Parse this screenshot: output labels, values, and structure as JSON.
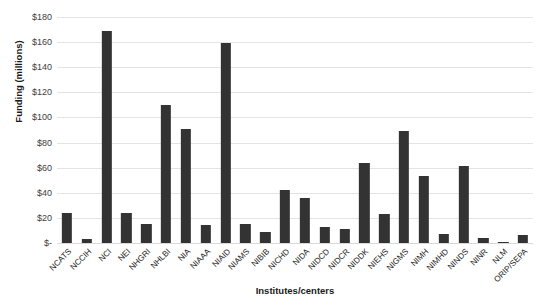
{
  "chart_data": {
    "type": "bar",
    "title": "",
    "xlabel": "Institutes/centers",
    "ylabel": "Funding (millions)",
    "ylim": [
      0,
      180
    ],
    "yticks": [
      "$-",
      "$20",
      "$40",
      "$60",
      "$80",
      "$100",
      "$120",
      "$140",
      "$160",
      "$180"
    ],
    "ytick_values": [
      0,
      20,
      40,
      60,
      80,
      100,
      120,
      140,
      160,
      180
    ],
    "grid": true,
    "legend": "none",
    "bar_color": "#333333",
    "categories": [
      "NCATS",
      "NCCIH",
      "NCI",
      "NEI",
      "NHGRI",
      "NHLBI",
      "NIA",
      "NIAAA",
      "NIAID",
      "NIAMS",
      "NIBIB",
      "NICHD",
      "NIDA",
      "NIDCD",
      "NIDCR",
      "NIDDK",
      "NIEHS",
      "NIGMS",
      "NIMH",
      "NIMHD",
      "NINDS",
      "NINR",
      "NLM",
      "ORIP/SEPA"
    ],
    "values": [
      24,
      3,
      169,
      24,
      15,
      110,
      91,
      14,
      159,
      15,
      9,
      42,
      36,
      13,
      11,
      64,
      23,
      89,
      53,
      7,
      61,
      4,
      1,
      6
    ]
  }
}
